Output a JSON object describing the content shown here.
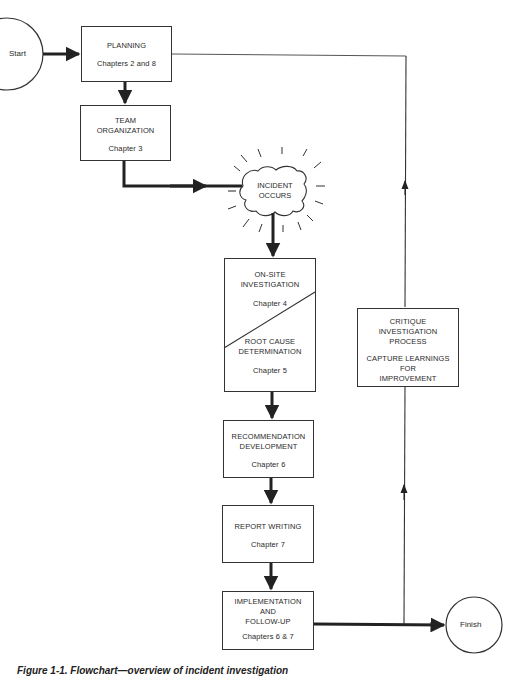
{
  "diagram": {
    "caption": "Figure 1-1. Flowchart—overview of incident investigation",
    "colors": {
      "line": "#222222",
      "background": "#ffffff",
      "text": "#2a2a2a"
    },
    "terminals": {
      "start": {
        "label": "Start"
      },
      "finish": {
        "label": "Finish"
      }
    },
    "nodes": {
      "planning": {
        "title": "PLANNING",
        "chapter": "Chapters 2 and 8"
      },
      "team": {
        "title_line1": "TEAM",
        "title_line2": "ORGANIZATION",
        "chapter": "Chapter 3"
      },
      "incident": {
        "line1": "INCIDENT",
        "line2": "OCCURS"
      },
      "onsite": {
        "title_line1": "ON-SITE",
        "title_line2": "INVESTIGATION",
        "chapter": "Chapter 4"
      },
      "rootcause": {
        "title_line1": "ROOT CAUSE",
        "title_line2": "DETERMINATION",
        "chapter": "Chapter 5"
      },
      "recommendation": {
        "title_line1": "RECOMMENDATION",
        "title_line2": "DEVELOPMENT",
        "chapter": "Chapter 6"
      },
      "report": {
        "title": "REPORT WRITING",
        "chapter": "Chapter 7"
      },
      "implementation": {
        "title_line1": "IMPLEMENTATION",
        "title_line2": "AND",
        "title_line3": "FOLLOW-UP",
        "chapter": "Chapters 6 & 7"
      },
      "critique": {
        "line1": "CRITIQUE",
        "line2": "INVESTIGATION",
        "line3": "PROCESS",
        "line4": "CAPTURE LEARNINGS",
        "line5": "FOR",
        "line6": "IMPROVEMENT"
      }
    },
    "edges": [
      {
        "from": "start",
        "to": "planning"
      },
      {
        "from": "planning",
        "to": "team"
      },
      {
        "from": "team",
        "to": "incident"
      },
      {
        "from": "incident",
        "to": "onsite"
      },
      {
        "from": "onsite",
        "to": "recommendation"
      },
      {
        "from": "recommendation",
        "to": "report"
      },
      {
        "from": "report",
        "to": "implementation"
      },
      {
        "from": "implementation",
        "to": "finish"
      },
      {
        "from": "implementation",
        "to": "critique"
      },
      {
        "from": "critique",
        "to": "planning"
      }
    ]
  }
}
